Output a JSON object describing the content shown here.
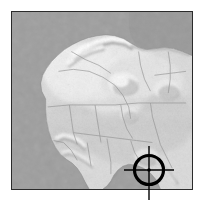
{
  "figure": {
    "kind": "shaded-relief-locator-map",
    "width": 204,
    "height": 207,
    "background_color": "#ffffff"
  },
  "map": {
    "name": "north-west-africa-relief-map",
    "region_label": "North and West Africa",
    "frame": {
      "x": 11,
      "y": 11,
      "width": 182,
      "height": 179
    },
    "border_color": "#2b2b2b",
    "border_width": 1.5,
    "projection_note": "equirectangular",
    "colors": {
      "ocean": "#9e9e9e",
      "land_base": "#d9d9d9",
      "land_highlight": "#f2f2f2",
      "land_shadow": "#a8a8a8",
      "border_line": "#8e8e8e",
      "sea_deep": "#929292"
    },
    "water_bodies": [
      {
        "name": "atlantic-ocean",
        "label": "Atlantic Ocean"
      },
      {
        "name": "mediterranean-sea",
        "label": "Mediterranean Sea"
      },
      {
        "name": "gulf-of-guinea",
        "label": "Gulf of Guinea"
      }
    ],
    "relief_features": [
      {
        "name": "atlas-mountains",
        "label": "Atlas Mountains"
      },
      {
        "name": "ahaggar-massif",
        "label": "Ahaggar"
      },
      {
        "name": "air-massif",
        "label": "Air"
      },
      {
        "name": "tibesti-massif",
        "label": "Tibesti"
      },
      {
        "name": "jos-plateau",
        "label": "Jos Plateau"
      },
      {
        "name": "guinea-highlands",
        "label": "Guinea Highlands"
      }
    ]
  },
  "marker": {
    "name": "location-crosshair",
    "type": "crosshair-target",
    "color": "#000000",
    "center": {
      "x": 149,
      "y": 170
    },
    "circle_radius": 14.5,
    "circle_stroke": 3.2,
    "center_dot_radius": 1.8,
    "tick_stroke": 1.4,
    "arms": {
      "left_x": 124,
      "right_x": 174,
      "top_y": 146,
      "bottom_y": 200
    }
  }
}
